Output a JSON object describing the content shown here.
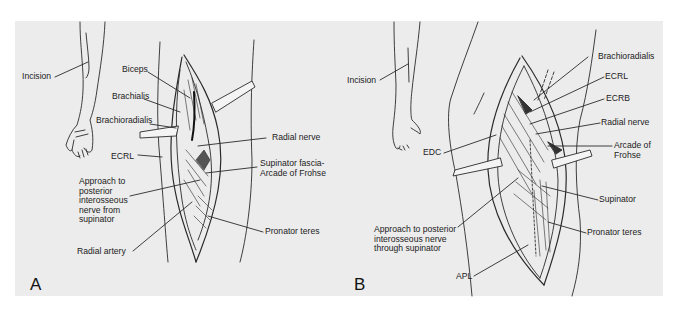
{
  "figure": {
    "background_color": "#ececec",
    "line_color": "#2a2a2a",
    "panels": [
      {
        "id": "A",
        "letter": "A",
        "labels": {
          "incision": "Incision",
          "biceps": "Biceps",
          "brachialis": "Brachialis",
          "brachioradialis": "Brachioradialis",
          "ecrl": "ECRL",
          "approach": "Approach to\nposterior\ninterosseous\nnerve from\nsupinator",
          "radial_artery": "Radial artery",
          "radial_nerve": "Radial nerve",
          "supinator_fascia": "Supinator fascia-\nArcade of Frohse",
          "pronator_teres": "Pronator teres"
        }
      },
      {
        "id": "B",
        "letter": "B",
        "labels": {
          "incision": "Incision",
          "edc": "EDC",
          "approach": "Approach to posterior\ninterosseous nerve\nthrough supinator",
          "apl": "APL",
          "brachioradialis": "Brachioradialis",
          "ecrl": "ECRL",
          "ecrb": "ECRB",
          "radial_nerve": "Radial nerve",
          "arcade": "Arcade of\nFrohse",
          "supinator": "Supinator",
          "pronator_teres": "Pronator teres"
        }
      }
    ]
  }
}
